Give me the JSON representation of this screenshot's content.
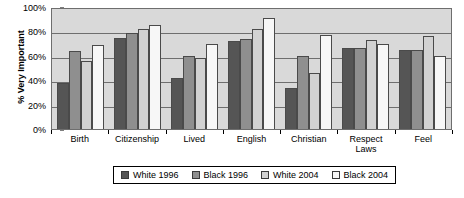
{
  "chart_data": {
    "type": "bar",
    "title": "",
    "xlabel": "",
    "ylabel": "% Very Important",
    "ylim": [
      0,
      100
    ],
    "grid": true,
    "legend_position": "bottom",
    "categories": [
      "Birth",
      "Citizenship",
      "Lived",
      "English",
      "Christian",
      "Respect Laws",
      "Feel"
    ],
    "y_ticks": [
      "0%",
      "20%",
      "40%",
      "60%",
      "80%",
      "100%"
    ],
    "y_tick_values": [
      0,
      20,
      40,
      60,
      80,
      100
    ],
    "series": [
      {
        "name": "White 1996",
        "color": "#555555",
        "values": [
          38,
          75,
          42,
          72,
          34,
          66,
          65
        ]
      },
      {
        "name": "Black 1996",
        "color": "#8f8f8f",
        "values": [
          64,
          79,
          60,
          74,
          60,
          66,
          65
        ]
      },
      {
        "name": "White 2004",
        "color": "#d2d2d2",
        "values": [
          56,
          82,
          58,
          82,
          46,
          73,
          76
        ]
      },
      {
        "name": "Black 2004",
        "color": "#f7f7f7",
        "values": [
          69,
          85,
          70,
          91,
          77,
          70,
          60
        ]
      }
    ]
  }
}
